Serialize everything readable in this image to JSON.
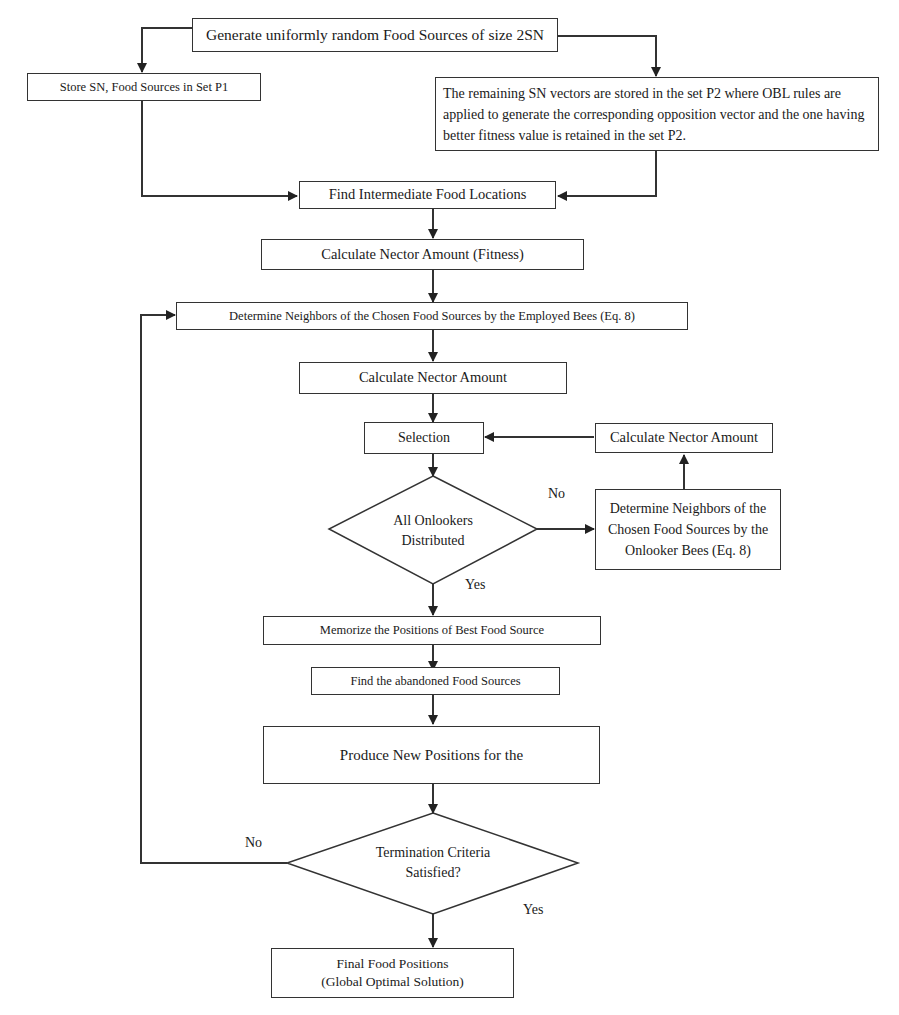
{
  "diagram": {
    "type": "flowchart",
    "boxes": {
      "generate": "Generate uniformly random Food Sources of size 2SN",
      "store_p1": "Store SN, Food Sources in Set P1",
      "store_p2": "The remaining SN vectors are stored in the set P2 where OBL rules are applied to generate the corresponding opposition vector and the one having better fitness value is retained in the set P2.",
      "intermediate": "Find Intermediate Food Locations",
      "nectar_fitness": "Calculate Nector Amount (Fitness)",
      "employed_neighbors": "Determine Neighbors of the Chosen Food Sources by the Employed Bees (Eq. 8)",
      "nectar_1": "Calculate Nector Amount",
      "selection": "Selection",
      "nectar_2": "Calculate Nector Amount",
      "onlooker_neighbors": "Determine Neighbors of the Chosen Food Sources by the Onlooker Bees (Eq. 8)",
      "memorize": "Memorize the Positions of Best Food Source",
      "abandoned": "Find the abandoned Food Sources",
      "produce": "Produce New Positions for the",
      "final": "Final Food Positions (Global Optimal Solution)"
    },
    "decisions": {
      "onlookers_line1": "All Onlookers",
      "onlookers_line2": "Distributed",
      "termination_line1": "Termination Criteria",
      "termination_line2": "Satisfied?"
    },
    "final_lines": {
      "line1": "Final Food Positions",
      "line2": "(Global Optimal Solution)"
    },
    "edge_labels": {
      "onlookers_no": "No",
      "onlookers_yes": "Yes",
      "termination_no": "No",
      "termination_yes": "Yes"
    },
    "colors": {
      "line": "#333333",
      "text": "#1a1a1a",
      "background": "#ffffff"
    }
  }
}
